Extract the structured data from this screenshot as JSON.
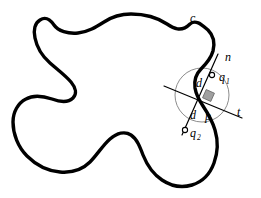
{
  "figure": {
    "background_color": "#ffffff",
    "curve_color": "#000000",
    "line_color": "#000000",
    "circle_color": "#8c8c8c",
    "square_fill": "#a0a0a0",
    "square_stroke": "#6b6b6b",
    "marker_fill": "#ffffff",
    "marker_stroke": "#000000",
    "labels": [
      {
        "id": "curve-label-c",
        "text": "c",
        "sub": "",
        "x": 190,
        "y": 22
      },
      {
        "id": "normal-label-n",
        "text": "n",
        "sub": "",
        "x": 225,
        "y": 61
      },
      {
        "id": "point-label-q1",
        "text": "q",
        "sub": "1",
        "x": 219,
        "y": 81
      },
      {
        "id": "dist-label-d-upper",
        "text": "d",
        "sub": "",
        "x": 196,
        "y": 87
      },
      {
        "id": "tangent-label-t",
        "text": "t",
        "sub": "",
        "x": 237,
        "y": 116
      },
      {
        "id": "dist-label-d-lower",
        "text": "d",
        "sub": "",
        "x": 190,
        "y": 119
      },
      {
        "id": "point-label-p",
        "text": "p",
        "sub": "",
        "x": 205,
        "y": 120
      },
      {
        "id": "point-label-q2",
        "text": "q",
        "sub": "2",
        "x": 190,
        "y": 137
      }
    ],
    "geometry": {
      "point_p": {
        "x": 203,
        "y": 97
      },
      "point_q1": {
        "x": 212,
        "y": 75
      },
      "point_q2": {
        "x": 185,
        "y": 130
      },
      "osculating_circle": {
        "cx": 202,
        "cy": 95,
        "r": 27
      },
      "right_angle_square": {
        "x": 204,
        "y": 91,
        "size": 9
      },
      "normal_line": {
        "x1": 218,
        "y1": 54,
        "x2": 182,
        "y2": 135
      },
      "tangent_line": {
        "x1": 164,
        "y1": 86,
        "x2": 242,
        "y2": 118
      },
      "curve_path": "M 190 24 C 181 33 173 28 167 24 C 158 18 145 14 131 14 C 120 14 110 18 104 22 C 96 27 88 32 78 33 C 68 34 58 31 54 25 C 49 18 45 17 40 20 C 35 23 33 30 35 38 C 37 48 42 56 50 63 C 58 70 66 76 71 82 C 76 88 77 94 73 98 C 68 103 60 102 52 99 C 43 96 33 95 26 99 C 18 103 13 112 13 122 C 13 134 18 147 27 156 C 36 165 48 171 60 172 C 72 173 83 169 90 162 C 97 155 103 145 110 139 C 117 133 125 131 131 135 C 137 139 140 147 143 155 C 147 165 153 174 162 180 C 171 186 182 188 192 185 C 202 182 210 174 214 163 C 218 152 218 140 215 130 C 212 120 207 112 203 106 C 199 100 196 94 195 88 C 194 81 196 74 201 69 C 206 64 211 58 213 51 C 215 43 213 35 208 30 C 202 25 196 19 190 24 Z"
    }
  }
}
